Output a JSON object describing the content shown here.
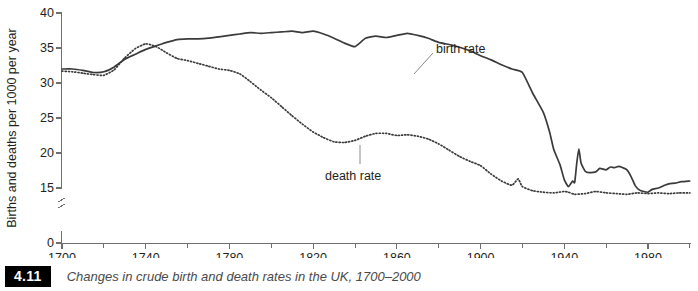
{
  "figure": {
    "caption_number": "4.11",
    "caption_text": "Changes in crude birth and death rates in the UK, 1700–2000"
  },
  "chart_data": {
    "type": "line",
    "title": "Changes in crude birth and death rates in the UK, 1700–2000",
    "xlabel": "",
    "ylabel": "Births and deaths per 1000 per year",
    "xlim": [
      1700,
      2000
    ],
    "ylim": [
      0,
      40
    ],
    "y_axis_break": true,
    "y_break_between": [
      0,
      15
    ],
    "grid": false,
    "legend_position": "inline-annotations",
    "x_ticks": [
      1700,
      1740,
      1780,
      1820,
      1860,
      1900,
      1940,
      1980
    ],
    "x_minor_ticks": [
      1720,
      1760,
      1800,
      1840,
      1880,
      1920,
      1960,
      2000
    ],
    "y_ticks": [
      0,
      15,
      20,
      25,
      30,
      35,
      40
    ],
    "annotations": [
      {
        "name": "birth rate",
        "text": "birth rate",
        "x": 1895,
        "y": 35.5
      },
      {
        "name": "death rate",
        "text": "death rate",
        "x": 1830,
        "y": 18.2
      }
    ],
    "series": [
      {
        "name": "birth rate",
        "style": "solid",
        "color": "#3b3b3b",
        "x": [
          1700,
          1705,
          1710,
          1715,
          1720,
          1725,
          1730,
          1735,
          1740,
          1745,
          1750,
          1755,
          1760,
          1765,
          1770,
          1775,
          1780,
          1785,
          1790,
          1795,
          1800,
          1805,
          1810,
          1815,
          1820,
          1825,
          1830,
          1835,
          1840,
          1845,
          1850,
          1855,
          1860,
          1865,
          1870,
          1875,
          1880,
          1885,
          1890,
          1895,
          1900,
          1905,
          1910,
          1915,
          1920,
          1925,
          1930,
          1933,
          1935,
          1938,
          1940,
          1942,
          1944,
          1945,
          1946,
          1947,
          1948,
          1950,
          1952,
          1955,
          1957,
          1960,
          1962,
          1964,
          1966,
          1968,
          1970,
          1972,
          1974,
          1976,
          1978,
          1980,
          1982,
          1985,
          1988,
          1990,
          1993,
          1996,
          2000
        ],
        "y": [
          32.0,
          32.0,
          31.8,
          31.5,
          31.6,
          32.3,
          33.4,
          34.1,
          34.8,
          35.3,
          35.8,
          36.2,
          36.3,
          36.3,
          36.4,
          36.6,
          36.8,
          37.0,
          37.2,
          37.1,
          37.2,
          37.3,
          37.4,
          37.2,
          37.4,
          37.0,
          36.4,
          35.7,
          35.2,
          36.4,
          36.7,
          36.5,
          36.8,
          37.1,
          36.8,
          36.4,
          35.8,
          35.5,
          35.1,
          34.6,
          33.9,
          33.3,
          32.6,
          32.0,
          31.5,
          28.5,
          25.8,
          23.0,
          20.5,
          18.3,
          16.2,
          15.2,
          16.0,
          15.8,
          18.6,
          20.6,
          18.6,
          17.4,
          17.2,
          17.3,
          17.8,
          17.6,
          18.0,
          17.9,
          18.1,
          17.9,
          17.6,
          16.6,
          15.3,
          14.7,
          14.5,
          14.4,
          14.8,
          15.0,
          15.4,
          15.6,
          15.7,
          15.9,
          16.0
        ]
      },
      {
        "name": "death rate",
        "style": "dotted",
        "color": "#3b3b3b",
        "x": [
          1700,
          1705,
          1710,
          1715,
          1720,
          1725,
          1730,
          1735,
          1740,
          1745,
          1750,
          1755,
          1760,
          1765,
          1770,
          1775,
          1780,
          1785,
          1790,
          1795,
          1800,
          1805,
          1810,
          1815,
          1820,
          1825,
          1830,
          1835,
          1840,
          1845,
          1850,
          1855,
          1860,
          1865,
          1870,
          1875,
          1880,
          1885,
          1890,
          1895,
          1900,
          1905,
          1910,
          1915,
          1918,
          1920,
          1925,
          1930,
          1935,
          1940,
          1942,
          1945,
          1950,
          1955,
          1960,
          1965,
          1970,
          1975,
          1980,
          1985,
          1990,
          1995,
          2000
        ],
        "y": [
          31.7,
          31.6,
          31.4,
          31.2,
          31.1,
          31.9,
          33.6,
          34.9,
          35.6,
          35.2,
          34.3,
          33.5,
          33.2,
          32.8,
          32.4,
          32.0,
          31.8,
          31.3,
          30.2,
          29.0,
          27.9,
          26.6,
          25.3,
          24.1,
          23.0,
          22.2,
          21.6,
          21.5,
          21.8,
          22.4,
          22.8,
          22.8,
          22.5,
          22.6,
          22.4,
          22.0,
          21.3,
          20.4,
          19.5,
          18.8,
          18.2,
          17.0,
          16.0,
          15.4,
          16.3,
          15.2,
          14.6,
          14.4,
          14.3,
          14.5,
          14.4,
          14.1,
          14.2,
          14.5,
          14.3,
          14.2,
          14.1,
          14.3,
          14.2,
          14.3,
          14.2,
          14.3,
          14.3
        ]
      }
    ]
  },
  "axes": {
    "y_label": "Births and deaths per 1000 per year",
    "y_tick_labels": [
      "40",
      "35",
      "30",
      "25",
      "20",
      "15",
      "0"
    ],
    "x_tick_labels": [
      "1700",
      "1740",
      "1780",
      "1820",
      "1860",
      "1900",
      "1940",
      "1980"
    ]
  }
}
